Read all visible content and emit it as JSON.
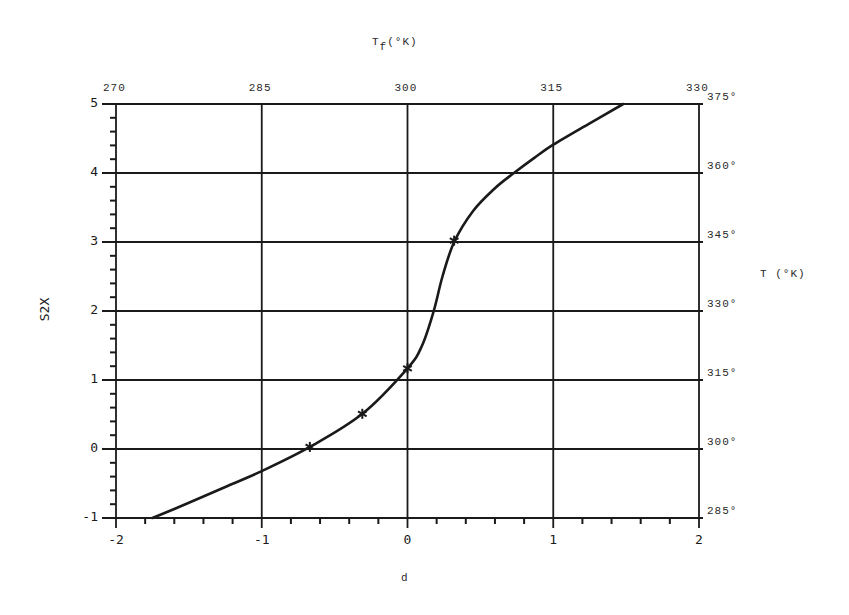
{
  "chart_data": {
    "type": "line",
    "title": "",
    "xlabel": "d",
    "ylabel": "S2X",
    "top_axis_label": "Tf(°K)",
    "top_axis_label_main": "T",
    "top_axis_label_sub": "f",
    "top_axis_label_rest": "(°K)",
    "right_axis_label": "T (°K)",
    "xlim": [
      -2,
      2
    ],
    "ylim": [
      -1,
      5
    ],
    "x_ticks": [
      "-2",
      "-1",
      "0",
      "1",
      "2"
    ],
    "y_ticks": [
      "-1",
      "0",
      "1",
      "2",
      "3",
      "4",
      "5"
    ],
    "top_ticks": [
      "270",
      "285",
      "300",
      "315",
      "330"
    ],
    "right_ticks": [
      "285°",
      "300°",
      "315°",
      "330°",
      "345°",
      "360°",
      "375°"
    ],
    "grid": true,
    "series": [
      {
        "name": "curve",
        "style": "line",
        "x": [
          -1.75,
          -1.5,
          -1.25,
          -1.0,
          -0.67,
          -0.31,
          0.0,
          0.1,
          0.18,
          0.24,
          0.32,
          0.45,
          0.6,
          0.73,
          0.87,
          1.0,
          1.25,
          1.48
        ],
        "y": [
          -1.0,
          -0.78,
          -0.55,
          -0.32,
          0.03,
          0.51,
          1.17,
          1.5,
          2.0,
          2.5,
          3.0,
          3.45,
          3.78,
          4.0,
          4.22,
          4.41,
          4.72,
          5.0
        ]
      },
      {
        "name": "measured points",
        "style": "markers",
        "marker": "star",
        "x": [
          -0.67,
          -0.31,
          0.0,
          0.32
        ],
        "y": [
          0.03,
          0.51,
          1.17,
          3.02
        ]
      }
    ]
  },
  "colors": {
    "ink": "#1a1a1a",
    "background": "#ffffff"
  }
}
